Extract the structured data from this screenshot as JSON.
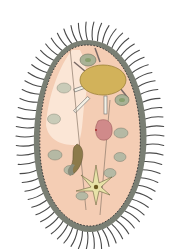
{
  "diagram": {
    "colors": {
      "background": "#ffffff",
      "cilia": "#4a4a4a",
      "pellicle": "#7a7f74",
      "cytoplasm": "#f4cdb4",
      "cytoplasm_light": "#fbe6d6",
      "macronucleus": "#d2b25a",
      "macronucleus_stroke": "#9c8136",
      "food_vacuole": "#a9b296",
      "food_vacuole_inner": "#8aa070",
      "red_body": "#d08a8a",
      "oral_groove": "#8c7a4a",
      "contractile_vacuole": "#e8e2a8",
      "trichocyst": "#f4f1e6"
    },
    "parts": [
      "cilia",
      "pellicle",
      "cytoplasm",
      "macronucleus",
      "food-vacuoles",
      "trichocysts",
      "oral-groove",
      "red-vesicle",
      "contractile-vacuole"
    ]
  }
}
